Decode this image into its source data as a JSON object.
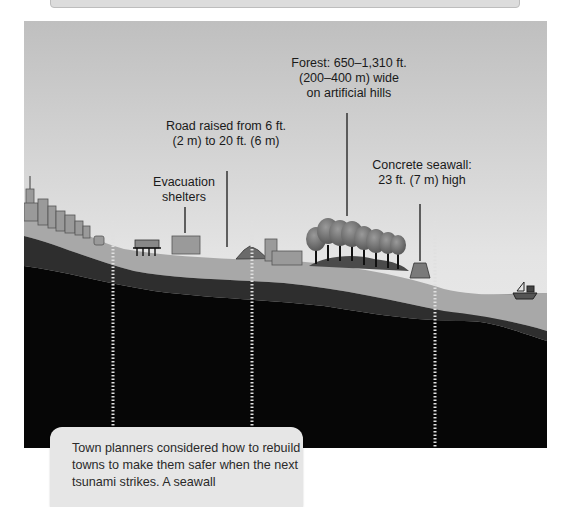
{
  "diagram": {
    "labels": {
      "forest": "Forest: 650–1,310 ft.\n(200–400 m) wide\non artificial hills",
      "road": "Road raised from 6 ft.\n(2 m) to 20 ft. (6 m)",
      "shelters": "Evacuation\nshelters",
      "seawall": "Concrete seawall:\n23 ft. (7 m) high"
    },
    "colors": {
      "sky_top": "#bdbdbd",
      "sky_bottom": "#ececec",
      "ground_light": "#a8a8a8",
      "ground_mid": "#3a3a3a",
      "ground_dark": "#0a0a0a",
      "sea": "#9a9a9a",
      "trees": "#6e6e6e"
    }
  },
  "caption": {
    "text": "Town planners considered how to rebuild towns to make them safer when the next tsunami strikes. A seawall"
  }
}
